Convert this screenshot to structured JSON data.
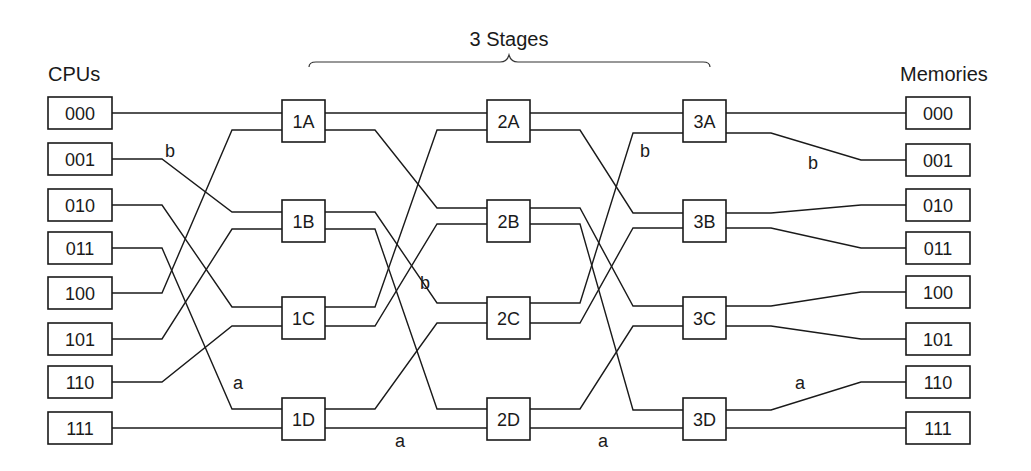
{
  "title": "3 Stages",
  "headers": {
    "left": "CPUs",
    "right": "Memories"
  },
  "colors": {
    "line": "#1a1a1a",
    "background": "#ffffff"
  },
  "cpus": [
    {
      "id": "000",
      "y": 113
    },
    {
      "id": "001",
      "y": 159
    },
    {
      "id": "010",
      "y": 205
    },
    {
      "id": "011",
      "y": 248
    },
    {
      "id": "100",
      "y": 293
    },
    {
      "id": "101",
      "y": 339
    },
    {
      "id": "110",
      "y": 382
    },
    {
      "id": "111",
      "y": 428
    }
  ],
  "memories": [
    {
      "id": "000",
      "y": 113
    },
    {
      "id": "001",
      "y": 160
    },
    {
      "id": "010",
      "y": 205
    },
    {
      "id": "011",
      "y": 248
    },
    {
      "id": "100",
      "y": 292
    },
    {
      "id": "101",
      "y": 339
    },
    {
      "id": "110",
      "y": 382
    },
    {
      "id": "111",
      "y": 428
    }
  ],
  "stages": [
    {
      "name": "Stage 1",
      "x": 282,
      "switches": [
        {
          "id": "1A",
          "top": 100,
          "p0": 113,
          "p1": 130
        },
        {
          "id": "1B",
          "top": 200,
          "p0": 212,
          "p1": 229
        },
        {
          "id": "1C",
          "top": 297,
          "p0": 307,
          "p1": 326
        },
        {
          "id": "1D",
          "top": 398,
          "p0": 409,
          "p1": 428
        }
      ]
    },
    {
      "name": "Stage 2",
      "x": 487,
      "switches": [
        {
          "id": "2A",
          "top": 100,
          "p0": 113,
          "p1": 130
        },
        {
          "id": "2B",
          "top": 200,
          "p0": 208,
          "p1": 224
        },
        {
          "id": "2C",
          "top": 297,
          "p0": 303,
          "p1": 323
        },
        {
          "id": "2D",
          "top": 398,
          "p0": 409,
          "p1": 428
        }
      ]
    },
    {
      "name": "Stage 3",
      "x": 683,
      "switches": [
        {
          "id": "3A",
          "top": 100,
          "p0": 113,
          "p1": 133
        },
        {
          "id": "3B",
          "top": 200,
          "p0": 213,
          "p1": 228
        },
        {
          "id": "3C",
          "top": 297,
          "p0": 306,
          "p1": 326
        },
        {
          "id": "3D",
          "top": 398,
          "p0": 410,
          "p1": 428
        }
      ]
    }
  ],
  "connections": {
    "cpu_to_stage1": [
      {
        "from": "000",
        "to": "1A",
        "port": 0
      },
      {
        "from": "001",
        "to": "1B",
        "port": 0
      },
      {
        "from": "010",
        "to": "1C",
        "port": 0
      },
      {
        "from": "011",
        "to": "1D",
        "port": 0
      },
      {
        "from": "100",
        "to": "1A",
        "port": 1
      },
      {
        "from": "101",
        "to": "1B",
        "port": 1
      },
      {
        "from": "110",
        "to": "1C",
        "port": 1
      },
      {
        "from": "111",
        "to": "1D",
        "port": 1
      }
    ],
    "stage1_to_stage2": [
      {
        "from": "1A",
        "fport": 0,
        "to": "2A",
        "tport": 0
      },
      {
        "from": "1A",
        "fport": 1,
        "to": "2B",
        "tport": 0
      },
      {
        "from": "1B",
        "fport": 0,
        "to": "2C",
        "tport": 0
      },
      {
        "from": "1B",
        "fport": 1,
        "to": "2D",
        "tport": 0
      },
      {
        "from": "1C",
        "fport": 0,
        "to": "2A",
        "tport": 1
      },
      {
        "from": "1C",
        "fport": 1,
        "to": "2B",
        "tport": 1
      },
      {
        "from": "1D",
        "fport": 0,
        "to": "2C",
        "tport": 1
      },
      {
        "from": "1D",
        "fport": 1,
        "to": "2D",
        "tport": 1
      }
    ],
    "stage2_to_stage3": [
      {
        "from": "2A",
        "fport": 0,
        "to": "3A",
        "tport": 0
      },
      {
        "from": "2A",
        "fport": 1,
        "to": "3B",
        "tport": 0
      },
      {
        "from": "2B",
        "fport": 0,
        "to": "3C",
        "tport": 0
      },
      {
        "from": "2B",
        "fport": 1,
        "to": "3D",
        "tport": 0
      },
      {
        "from": "2C",
        "fport": 0,
        "to": "3A",
        "tport": 1
      },
      {
        "from": "2C",
        "fport": 1,
        "to": "3B",
        "tport": 1
      },
      {
        "from": "2D",
        "fport": 0,
        "to": "3C",
        "tport": 1
      },
      {
        "from": "2D",
        "fport": 1,
        "to": "3D",
        "tport": 1
      }
    ],
    "stage3_to_memory": [
      {
        "from": "3A",
        "fport": 0,
        "to": "000"
      },
      {
        "from": "3A",
        "fport": 1,
        "to": "001"
      },
      {
        "from": "3B",
        "fport": 0,
        "to": "010"
      },
      {
        "from": "3B",
        "fport": 1,
        "to": "011"
      },
      {
        "from": "3C",
        "fport": 0,
        "to": "100"
      },
      {
        "from": "3C",
        "fport": 1,
        "to": "101"
      },
      {
        "from": "3D",
        "fport": 0,
        "to": "110"
      },
      {
        "from": "3D",
        "fport": 1,
        "to": "111"
      }
    ]
  },
  "path_labels": [
    {
      "text": "b",
      "x": 170,
      "y": 157
    },
    {
      "text": "b",
      "x": 425,
      "y": 289
    },
    {
      "text": "b",
      "x": 645,
      "y": 157
    },
    {
      "text": "b",
      "x": 813,
      "y": 169
    },
    {
      "text": "a",
      "x": 238,
      "y": 389
    },
    {
      "text": "a",
      "x": 400,
      "y": 447
    },
    {
      "text": "a",
      "x": 603,
      "y": 447
    },
    {
      "text": "a",
      "x": 800,
      "y": 389
    }
  ]
}
